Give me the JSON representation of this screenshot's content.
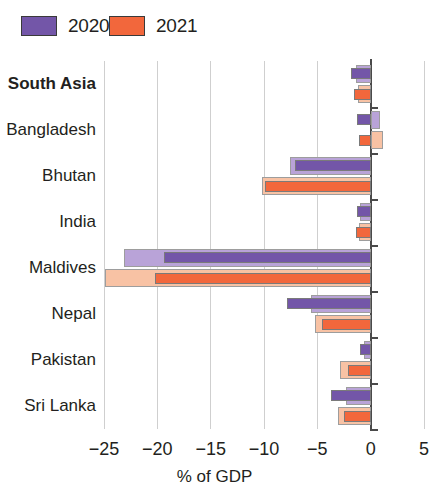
{
  "legend": {
    "items": [
      {
        "label": "2020",
        "color": "#7356a8",
        "light": "#b9a3d8"
      },
      {
        "label": "2021",
        "color": "#f2673c",
        "light": "#f8c2a4"
      }
    ]
  },
  "axis": {
    "x_title": "% of GDP",
    "x_ticks": [
      "−25",
      "−20",
      "−15",
      "−10",
      "−5",
      "0",
      "5"
    ],
    "x_tick_values": [
      -25,
      -20,
      -15,
      -10,
      -5,
      0,
      5
    ]
  },
  "chart_data": {
    "type": "bar",
    "title": "",
    "subtitle": "",
    "orientation": "horizontal",
    "xlabel": "% of GDP",
    "ylabel": "",
    "xlim": [
      -25,
      5
    ],
    "grid": true,
    "legend_position": "top-left",
    "categories": [
      "South Asia",
      "Bangladesh",
      "Bhutan",
      "India",
      "Maldives",
      "Nepal",
      "Pakistan",
      "Sri Lanka"
    ],
    "emphasis_category": "South Asia",
    "note": "Each year shows a darker central bar with a lighter outer band behind it (range/estimate band).",
    "series": [
      {
        "name": "2020",
        "color": "#7356a8",
        "light_color": "#b9a3d8",
        "values": [
          -1.8,
          -1.3,
          -7.1,
          -1.3,
          -19.4,
          -7.8,
          -1.0,
          -3.7
        ],
        "band_values": [
          -1.4,
          0.9,
          -7.6,
          -1.0,
          -23.1,
          -5.6,
          -0.6,
          -2.3
        ]
      },
      {
        "name": "2021",
        "color": "#f2673c",
        "light_color": "#f8c2a4",
        "values": [
          -1.6,
          -1.1,
          -9.9,
          -1.4,
          -20.2,
          -4.6,
          -2.1,
          -2.5
        ],
        "band_values": [
          -1.2,
          1.2,
          -10.2,
          -1.1,
          -24.9,
          -5.2,
          -2.9,
          -3.1
        ]
      }
    ]
  }
}
